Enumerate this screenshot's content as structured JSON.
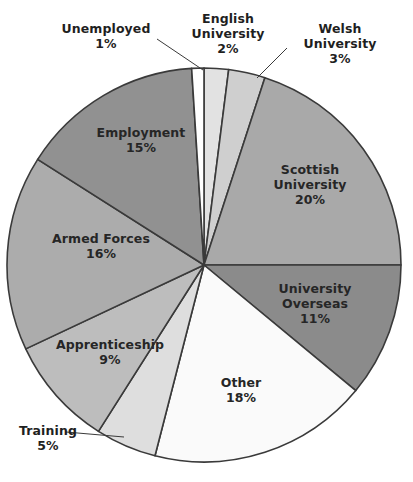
{
  "chart_data": {
    "type": "pie",
    "title": "",
    "subtitle": "",
    "xlabel": "",
    "ylabel": "",
    "legend_position": "none",
    "grid": false,
    "units": "percent",
    "total": 100,
    "start_angle_deg": 0,
    "direction": "clockwise",
    "categories": [
      "English University",
      "Welsh University",
      "Scottish University",
      "University Overseas",
      "Other",
      "Training",
      "Apprenticeship",
      "Armed Forces",
      "Employment",
      "Unemployed"
    ],
    "values": [
      2,
      3,
      20,
      11,
      18,
      5,
      9,
      16,
      15,
      1
    ],
    "slices": [
      {
        "label": "English University",
        "name_line1": "English",
        "name_line2": "University",
        "value": 2,
        "pct_text": "2%",
        "color": "#e2e2e2",
        "label_placement": "outside"
      },
      {
        "label": "Welsh University",
        "name_line1": "Welsh",
        "name_line2": "University",
        "value": 3,
        "pct_text": "3%",
        "color": "#cfcfcf",
        "label_placement": "outside"
      },
      {
        "label": "Scottish University",
        "name_line1": "Scottish",
        "name_line2": "University",
        "value": 20,
        "pct_text": "20%",
        "color": "#a9a9a9",
        "label_placement": "inside"
      },
      {
        "label": "University Overseas",
        "name_line1": "University",
        "name_line2": "Overseas",
        "value": 11,
        "pct_text": "11%",
        "color": "#8b8b8b",
        "label_placement": "inside"
      },
      {
        "label": "Other",
        "name_line1": "Other",
        "name_line2": "",
        "value": 18,
        "pct_text": "18%",
        "color": "#fafafa",
        "label_placement": "inside"
      },
      {
        "label": "Training",
        "name_line1": "Training",
        "name_line2": "",
        "value": 5,
        "pct_text": "5%",
        "color": "#dedede",
        "label_placement": "outside"
      },
      {
        "label": "Apprenticeship",
        "name_line1": "Apprenticeship",
        "name_line2": "",
        "value": 9,
        "pct_text": "9%",
        "color": "#bdbdbd",
        "label_placement": "inside"
      },
      {
        "label": "Armed Forces",
        "name_line1": "Armed Forces",
        "name_line2": "",
        "value": 16,
        "pct_text": "16%",
        "color": "#acacac",
        "label_placement": "inside"
      },
      {
        "label": "Employment",
        "name_line1": "Employment",
        "name_line2": "",
        "value": 15,
        "pct_text": "15%",
        "color": "#919191",
        "label_placement": "inside"
      },
      {
        "label": "Unemployed",
        "name_line1": "Unemployed",
        "name_line2": "",
        "value": 1,
        "pct_text": "1%",
        "color": "#ffffff",
        "label_placement": "outside"
      }
    ],
    "stroke_color": "#3a3a3a",
    "background": "#ffffff"
  },
  "labels": {
    "unemployed": {
      "name": "Unemployed",
      "pct": "1%"
    },
    "english": {
      "line1": "English",
      "line2": "University",
      "pct": "2%"
    },
    "welsh": {
      "line1": "Welsh",
      "line2": "University",
      "pct": "3%"
    },
    "scottish": {
      "line1": "Scottish",
      "line2": "University",
      "pct": "20%"
    },
    "overseas": {
      "line1": "University",
      "line2": "Overseas",
      "pct": "11%"
    },
    "other": {
      "name": "Other",
      "pct": "18%"
    },
    "training": {
      "name": "Training",
      "pct": "5%"
    },
    "apprenticeship": {
      "name": "Apprenticeship",
      "pct": "9%"
    },
    "armed": {
      "name": "Armed Forces",
      "pct": "16%"
    },
    "employment": {
      "name": "Employment",
      "pct": "15%"
    }
  },
  "artifact": {
    "text": "  "
  }
}
